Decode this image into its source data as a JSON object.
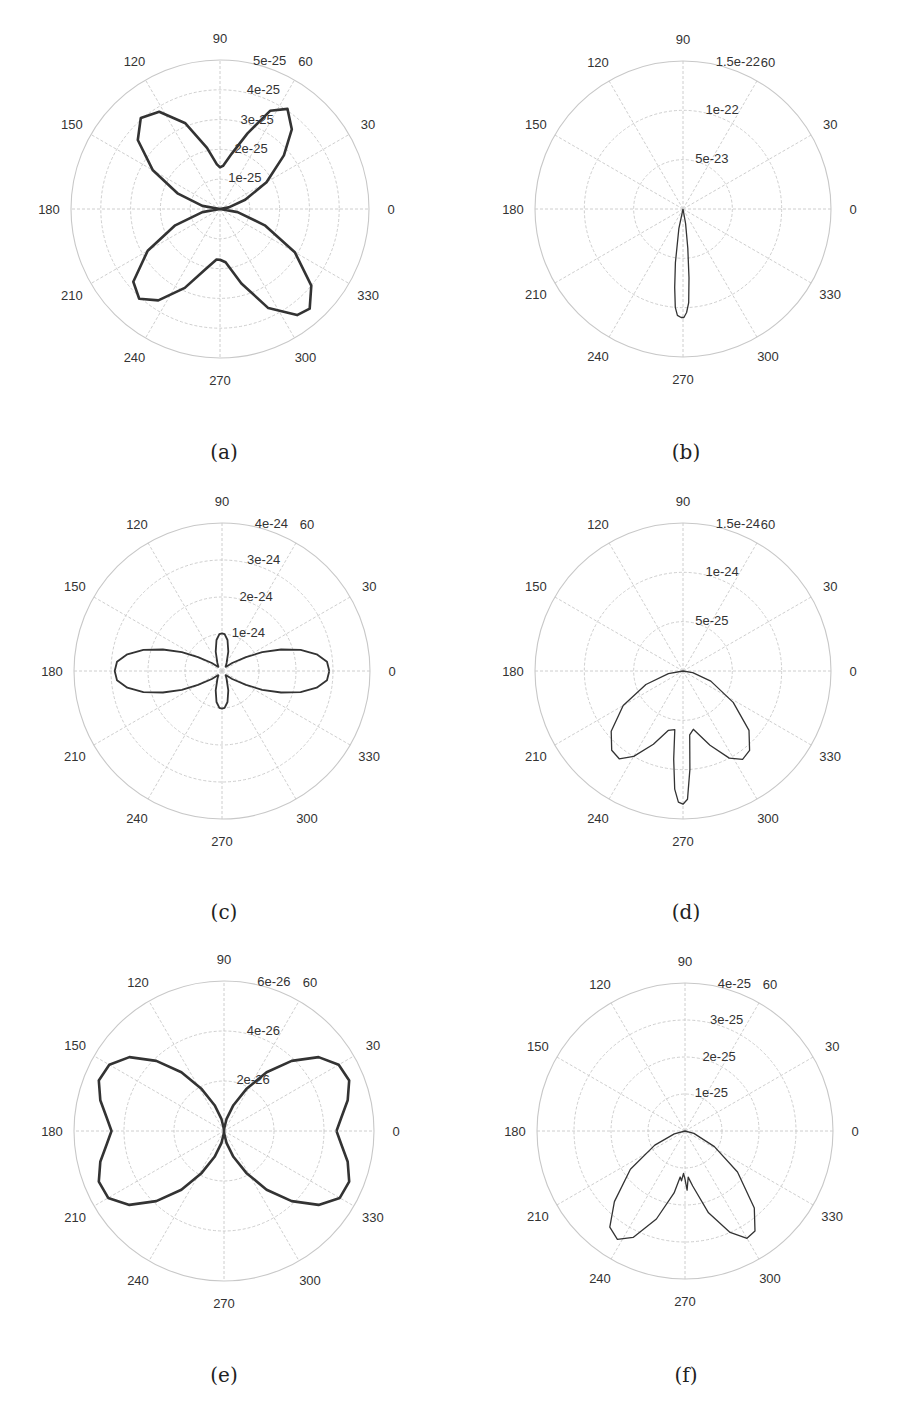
{
  "figure": {
    "panel_labels": [
      "(a)",
      "(b)",
      "(c)",
      "(d)",
      "(e)",
      "(f)"
    ]
  },
  "chart_data": [
    {
      "type": "polar-line",
      "panel": "(a)",
      "angle_ticks": [
        0,
        30,
        60,
        90,
        120,
        150,
        180,
        210,
        240,
        270,
        300,
        330
      ],
      "radial_ticks": [
        "1e-25",
        "2e-25",
        "3e-25",
        "4e-25",
        "5e-25"
      ],
      "rmax": 5e-25,
      "grid": true,
      "line_weight": "heavy",
      "series": [
        {
          "name": "radiation pattern",
          "points_deg_value": [
            [
              0,
              0
            ],
            [
              10,
              3e-26
            ],
            [
              20,
              9e-26
            ],
            [
              30,
              1.8e-25
            ],
            [
              40,
              2.8e-25
            ],
            [
              48,
              3.6e-25
            ],
            [
              56,
              4.05e-25
            ],
            [
              63,
              3.7e-25
            ],
            [
              70,
              2.7e-25
            ],
            [
              78,
              1.9e-25
            ],
            [
              86,
              1.45e-25
            ],
            [
              90,
              1.4e-25
            ],
            [
              94,
              1.5e-25
            ],
            [
              102,
              2.1e-25
            ],
            [
              112,
              3.1e-25
            ],
            [
              122,
              3.85e-25
            ],
            [
              131,
              4.05e-25
            ],
            [
              140,
              3.6e-25
            ],
            [
              150,
              2.6e-25
            ],
            [
              160,
              1.5e-25
            ],
            [
              170,
              6e-26
            ],
            [
              180,
              0
            ],
            [
              190,
              6e-26
            ],
            [
              200,
              1.6e-25
            ],
            [
              210,
              2.8e-25
            ],
            [
              220,
              3.8e-25
            ],
            [
              228,
              4.05e-25
            ],
            [
              236,
              3.7e-25
            ],
            [
              246,
              2.9e-25
            ],
            [
              256,
              2.1e-25
            ],
            [
              266,
              1.7e-25
            ],
            [
              270,
              1.7e-25
            ],
            [
              276,
              1.8e-25
            ],
            [
              286,
              2.6e-25
            ],
            [
              296,
              3.7e-25
            ],
            [
              306,
              4.4e-25
            ],
            [
              312,
              4.5e-25
            ],
            [
              320,
              4e-25
            ],
            [
              330,
              2.9e-25
            ],
            [
              340,
              1.6e-25
            ],
            [
              350,
              6e-26
            ],
            [
              360,
              0
            ]
          ]
        }
      ]
    },
    {
      "type": "polar-line",
      "panel": "(b)",
      "angle_ticks": [
        0,
        30,
        60,
        90,
        120,
        150,
        180,
        210,
        240,
        270,
        300,
        330
      ],
      "radial_ticks": [
        "5e-23",
        "1e-22",
        "1.5e-22"
      ],
      "rmax": 1.5e-22,
      "grid": true,
      "line_weight": "thin",
      "series": [
        {
          "name": "radiation pattern",
          "points_deg_value": [
            [
              0,
              0
            ],
            [
              240,
              0
            ],
            [
              258,
              2e-23
            ],
            [
              262,
              5.5e-23
            ],
            [
              264,
              8e-23
            ],
            [
              265.5,
              1e-22
            ],
            [
              267,
              1.08e-22
            ],
            [
              269,
              1.1e-22
            ],
            [
              270.5,
              1.1e-22
            ],
            [
              272,
              1.05e-22
            ],
            [
              273.5,
              9.5e-23
            ],
            [
              275,
              7e-23
            ],
            [
              277,
              4e-23
            ],
            [
              280,
              1.5e-23
            ],
            [
              290,
              0
            ],
            [
              360,
              0
            ]
          ]
        }
      ]
    },
    {
      "type": "polar-line",
      "panel": "(c)",
      "angle_ticks": [
        0,
        30,
        60,
        90,
        120,
        150,
        180,
        210,
        240,
        270,
        300,
        330
      ],
      "radial_ticks": [
        "1e-24",
        "2e-24",
        "3e-24",
        "4e-24"
      ],
      "rmax": 4e-24,
      "grid": true,
      "line_weight": "medium",
      "series": [
        {
          "name": "radiation pattern",
          "points_deg_value": [
            [
              0,
              2.9e-24
            ],
            [
              5,
              2.85e-24
            ],
            [
              10,
              2.6e-24
            ],
            [
              15,
              2.2e-24
            ],
            [
              20,
              1.7e-24
            ],
            [
              25,
              1.2e-24
            ],
            [
              30,
              7.5e-25
            ],
            [
              38,
              3.5e-25
            ],
            [
              48,
              1.5e-25
            ],
            [
              60,
              2.5e-25
            ],
            [
              72,
              5.5e-25
            ],
            [
              80,
              8.5e-25
            ],
            [
              86,
              1e-24
            ],
            [
              90,
              1.02e-24
            ],
            [
              94,
              1e-24
            ],
            [
              100,
              8.5e-25
            ],
            [
              108,
              5.5e-25
            ],
            [
              120,
              2.5e-25
            ],
            [
              132,
              1.5e-25
            ],
            [
              142,
              3.5e-25
            ],
            [
              150,
              7.5e-25
            ],
            [
              155,
              1.2e-24
            ],
            [
              160,
              1.7e-24
            ],
            [
              165,
              2.2e-24
            ],
            [
              170,
              2.6e-24
            ],
            [
              175,
              2.85e-24
            ],
            [
              180,
              2.9e-24
            ],
            [
              185,
              2.85e-24
            ],
            [
              190,
              2.6e-24
            ],
            [
              195,
              2.2e-24
            ],
            [
              200,
              1.7e-24
            ],
            [
              205,
              1.2e-24
            ],
            [
              210,
              7.5e-25
            ],
            [
              218,
              3.5e-25
            ],
            [
              228,
              1.5e-25
            ],
            [
              240,
              2.5e-25
            ],
            [
              252,
              5.5e-25
            ],
            [
              260,
              8.5e-25
            ],
            [
              266,
              1e-24
            ],
            [
              270,
              1.02e-24
            ],
            [
              274,
              1e-24
            ],
            [
              280,
              8.5e-25
            ],
            [
              288,
              5.5e-25
            ],
            [
              300,
              2.5e-25
            ],
            [
              312,
              1.5e-25
            ],
            [
              322,
              3.5e-25
            ],
            [
              330,
              7.5e-25
            ],
            [
              335,
              1.2e-24
            ],
            [
              340,
              1.7e-24
            ],
            [
              345,
              2.2e-24
            ],
            [
              350,
              2.6e-24
            ],
            [
              355,
              2.85e-24
            ],
            [
              360,
              2.9e-24
            ]
          ]
        }
      ]
    },
    {
      "type": "polar-line",
      "panel": "(d)",
      "angle_ticks": [
        0,
        30,
        60,
        90,
        120,
        150,
        180,
        210,
        240,
        270,
        300,
        330
      ],
      "radial_ticks": [
        "5e-25",
        "1e-24",
        "1.5e-24"
      ],
      "rmax": 1.5e-24,
      "grid": true,
      "line_weight": "thin",
      "series": [
        {
          "name": "radiation pattern",
          "points_deg_value": [
            [
              0,
              0
            ],
            [
              180,
              0
            ],
            [
              190,
              1.5e-25
            ],
            [
              200,
              4e-25
            ],
            [
              210,
              7e-25
            ],
            [
              220,
              9.5e-25
            ],
            [
              228,
              1.08e-24
            ],
            [
              234,
              1.1e-24
            ],
            [
              240,
              1e-24
            ],
            [
              248,
              8e-25
            ],
            [
              256,
              6.2e-25
            ],
            [
              262,
              6e-25
            ],
            [
              264,
              9e-25
            ],
            [
              266,
              1.2e-24
            ],
            [
              268,
              1.33e-24
            ],
            [
              270,
              1.35e-24
            ],
            [
              272,
              1.3e-24
            ],
            [
              274,
              1e-24
            ],
            [
              276,
              6.5e-25
            ],
            [
              280,
              6e-25
            ],
            [
              290,
              8e-25
            ],
            [
              298,
              1e-24
            ],
            [
              304,
              1.08e-24
            ],
            [
              310,
              1.05e-24
            ],
            [
              318,
              9e-25
            ],
            [
              328,
              6e-25
            ],
            [
              340,
              3e-25
            ],
            [
              350,
              1e-25
            ],
            [
              360,
              0
            ]
          ]
        }
      ]
    },
    {
      "type": "polar-line",
      "panel": "(e)",
      "angle_ticks": [
        0,
        30,
        60,
        90,
        120,
        150,
        180,
        210,
        240,
        270,
        300,
        330
      ],
      "radial_ticks": [
        "2e-26",
        "4e-26",
        "6e-26"
      ],
      "rmax": 6e-26,
      "grid": true,
      "line_weight": "heavy",
      "series": [
        {
          "name": "radiation pattern",
          "points_deg_value": [
            [
              0,
              4.5e-26
            ],
            [
              6,
              4.7e-26
            ],
            [
              14,
              5.1e-26
            ],
            [
              22,
              5.4e-26
            ],
            [
              30,
              5.3e-26
            ],
            [
              38,
              4.8e-26
            ],
            [
              46,
              3.9e-26
            ],
            [
              54,
              2.9e-26
            ],
            [
              62,
              1.9e-26
            ],
            [
              70,
              1.1e-26
            ],
            [
              78,
              5e-27
            ],
            [
              86,
              1e-27
            ],
            [
              90,
              0
            ],
            [
              94,
              1e-27
            ],
            [
              102,
              5e-27
            ],
            [
              110,
              1.1e-26
            ],
            [
              118,
              1.9e-26
            ],
            [
              126,
              2.9e-26
            ],
            [
              134,
              3.9e-26
            ],
            [
              142,
              4.8e-26
            ],
            [
              150,
              5.3e-26
            ],
            [
              158,
              5.4e-26
            ],
            [
              166,
              5.1e-26
            ],
            [
              174,
              4.7e-26
            ],
            [
              180,
              4.5e-26
            ],
            [
              186,
              4.7e-26
            ],
            [
              194,
              5.1e-26
            ],
            [
              202,
              5.4e-26
            ],
            [
              210,
              5.35e-26
            ],
            [
              218,
              4.8e-26
            ],
            [
              226,
              3.9e-26
            ],
            [
              234,
              2.9e-26
            ],
            [
              242,
              1.9e-26
            ],
            [
              250,
              1.1e-26
            ],
            [
              258,
              5e-27
            ],
            [
              266,
              1e-27
            ],
            [
              270,
              0
            ],
            [
              274,
              1e-27
            ],
            [
              282,
              5e-27
            ],
            [
              290,
              1.1e-26
            ],
            [
              298,
              1.9e-26
            ],
            [
              306,
              2.9e-26
            ],
            [
              314,
              3.9e-26
            ],
            [
              322,
              4.8e-26
            ],
            [
              330,
              5.35e-26
            ],
            [
              338,
              5.4e-26
            ],
            [
              346,
              5.1e-26
            ],
            [
              354,
              4.7e-26
            ],
            [
              360,
              4.5e-26
            ]
          ]
        }
      ]
    },
    {
      "type": "polar-line",
      "panel": "(f)",
      "angle_ticks": [
        0,
        30,
        60,
        90,
        120,
        150,
        180,
        210,
        240,
        270,
        300,
        330
      ],
      "radial_ticks": [
        "1e-25",
        "2e-25",
        "3e-25",
        "4e-25"
      ],
      "rmax": 4e-25,
      "grid": true,
      "line_weight": "thin",
      "series": [
        {
          "name": "radiation pattern",
          "points_deg_value": [
            [
              0,
              0
            ],
            [
              180,
              0
            ],
            [
              195,
              3e-26
            ],
            [
              205,
              9e-26
            ],
            [
              215,
              1.8e-25
            ],
            [
              225,
              2.7e-25
            ],
            [
              232,
              3.3e-25
            ],
            [
              238,
              3.45e-25
            ],
            [
              244,
              3.2e-25
            ],
            [
              252,
              2.5e-25
            ],
            [
              260,
              1.7e-25
            ],
            [
              264,
              1.25e-25
            ],
            [
              266,
              1.35e-25
            ],
            [
              268,
              1.15e-25
            ],
            [
              270,
              1.3e-25
            ],
            [
              272,
              1.6e-25
            ],
            [
              274,
              1.25e-25
            ],
            [
              278,
              1.5e-25
            ],
            [
              286,
              2.3e-25
            ],
            [
              294,
              3e-25
            ],
            [
              300,
              3.35e-25
            ],
            [
              305,
              3.3e-25
            ],
            [
              312,
              2.8e-25
            ],
            [
              322,
              1.8e-25
            ],
            [
              332,
              9e-26
            ],
            [
              345,
              2.5e-26
            ],
            [
              360,
              0
            ]
          ]
        }
      ]
    }
  ]
}
